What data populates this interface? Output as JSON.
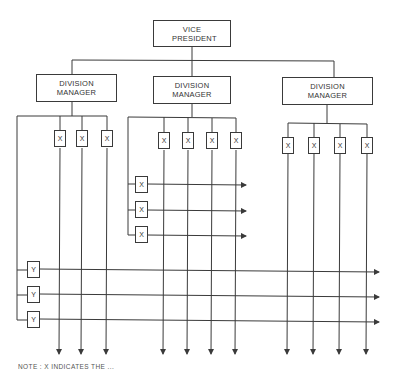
{
  "diagram": {
    "title_box": {
      "label": "VICE PRESIDENT"
    },
    "divisions": [
      {
        "label": "DIVISION MANAGER",
        "x_units": [
          "X",
          "X",
          "X"
        ]
      },
      {
        "label": "DIVISION MANAGER",
        "x_units": [
          "X",
          "X",
          "X",
          "X"
        ],
        "side_units": [
          "X",
          "X",
          "X"
        ]
      },
      {
        "label": "DIVISION MANAGER",
        "x_units": [
          "X",
          "X",
          "X",
          "X"
        ]
      }
    ],
    "y_units": [
      "Y",
      "Y",
      "Y"
    ],
    "note": "NOTE :  X INDICATES THE ..."
  },
  "colors": {
    "line": "#3a3a3a",
    "background": "#ffffff"
  }
}
